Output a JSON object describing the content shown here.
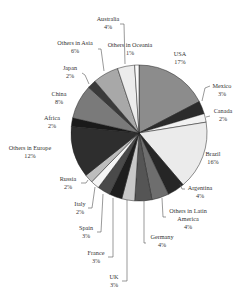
{
  "chart_data": {
    "type": "pie",
    "title": "",
    "unit": "%",
    "start_angle_deg": 0,
    "direction": "clockwise",
    "center": [
      139,
      133
    ],
    "radius": 68,
    "slices": [
      {
        "label": "USA",
        "value": 17,
        "color": "#8c8c8c",
        "label_pos": [
          180,
          56
        ],
        "label_anchor": "middle",
        "leader": [
          [
            172,
            64
          ],
          [
            172,
            64
          ]
        ]
      },
      {
        "label": "Mexico",
        "value": 3,
        "color": "#2b2b2b",
        "label_pos": [
          222,
          88
        ],
        "label_anchor": "middle",
        "leader": [
          [
            210,
            86
          ],
          [
            205,
            88
          ],
          [
            202,
            101
          ]
        ]
      },
      {
        "label": "Canada",
        "value": 2,
        "color": "#f2f2f2",
        "label_pos": [
          223,
          113
        ],
        "label_anchor": "middle",
        "leader": [
          [
            210,
            116
          ],
          [
            206,
            117
          ]
        ]
      },
      {
        "label": "Brazil",
        "value": 16,
        "color": "#ebebeb",
        "label_pos": [
          213,
          156
        ],
        "label_anchor": "middle",
        "leader": [
          [
            206,
            150
          ],
          [
            206,
            150
          ]
        ]
      },
      {
        "label": "Argentina",
        "value": 4,
        "color": "#262626",
        "label_pos": [
          200,
          190
        ],
        "label_anchor": "middle",
        "leader": [
          [
            185,
            189
          ],
          [
            182,
            189
          ],
          [
            180,
            184
          ]
        ]
      },
      {
        "label": "Others in Latin America",
        "label_lines": [
          "Others in Latin",
          "America",
          "4%"
        ],
        "value": 4,
        "color": "#6e6e6e",
        "label_pos": [
          188,
          213
        ],
        "label_anchor": "middle",
        "leader": [
          [
            166,
            217
          ],
          [
            163,
            217
          ],
          [
            162,
            198
          ]
        ]
      },
      {
        "label": "Germany",
        "value": 4,
        "color": "#555555",
        "label_pos": [
          162,
          239
        ],
        "label_anchor": "middle",
        "leader": [
          [
            146,
            243
          ],
          [
            144,
            243
          ],
          [
            144,
            200
          ]
        ]
      },
      {
        "label": "UK",
        "value": 3,
        "color": "#c8c8c8",
        "label_pos": [
          114,
          279
        ],
        "label_anchor": "middle",
        "leader": [
          [
            122,
            281
          ],
          [
            127,
            281
          ],
          [
            127,
            200
          ]
        ]
      },
      {
        "label": "France",
        "value": 3,
        "color": "#1e1e1e",
        "label_pos": [
          96,
          255
        ],
        "label_anchor": "middle",
        "leader": [
          [
            108,
            257
          ],
          [
            113,
            257
          ],
          [
            113,
            198
          ]
        ]
      },
      {
        "label": "Spain",
        "value": 3,
        "color": "#4a4a4a",
        "label_pos": [
          86,
          230
        ],
        "label_anchor": "middle",
        "leader": [
          [
            97,
            232
          ],
          [
            101,
            232
          ],
          [
            103,
            194
          ]
        ]
      },
      {
        "label": "Italy",
        "value": 2,
        "color": "#f5f5f5",
        "label_pos": [
          80,
          206
        ],
        "label_anchor": "middle",
        "leader": [
          [
            88,
            208
          ],
          [
            92,
            208
          ],
          [
            95,
            187
          ]
        ]
      },
      {
        "label": "Russia",
        "value": 2,
        "color": "#bdbdbd",
        "label_pos": [
          68,
          181
        ],
        "label_anchor": "middle",
        "leader": [
          [
            81,
            183
          ],
          [
            86,
            183
          ],
          [
            88,
            180
          ]
        ]
      },
      {
        "label": "Others in Europe",
        "value": 12,
        "color": "#2e2e2e",
        "label_pos": [
          30,
          150
        ],
        "label_anchor": "middle",
        "leader": []
      },
      {
        "label": "Africa",
        "value": 2,
        "color": "#1a1a1a",
        "label_pos": [
          52,
          120
        ],
        "label_anchor": "middle",
        "leader": []
      },
      {
        "label": "China",
        "value": 8,
        "color": "#7a7a7a",
        "label_pos": [
          59,
          96
        ],
        "label_anchor": "middle",
        "leader": []
      },
      {
        "label": "Japan",
        "value": 2,
        "color": "#3a3a3a",
        "label_pos": [
          70,
          70
        ],
        "label_anchor": "middle",
        "leader": [
          [
            82,
            73
          ],
          [
            85,
            75
          ],
          [
            89,
            84
          ]
        ]
      },
      {
        "label": "Others in Asia",
        "value": 6,
        "color": "#a8a8a8",
        "label_pos": [
          75,
          45
        ],
        "label_anchor": "middle",
        "leader": [
          [
            98,
            49
          ],
          [
            101,
            49
          ],
          [
            104,
            71
          ]
        ]
      },
      {
        "label": "Australia",
        "value": 4,
        "color": "#ececec",
        "label_pos": [
          108,
          21
        ],
        "label_anchor": "middle",
        "leader": [
          [
            120,
            24
          ],
          [
            124,
            24
          ],
          [
            125,
            64
          ]
        ]
      },
      {
        "label": "Others in Oceania",
        "value": 1,
        "color": "#fafafa",
        "label_pos": [
          130,
          47
        ],
        "label_anchor": "middle",
        "leader": []
      }
    ],
    "legend": null,
    "annotations": []
  }
}
